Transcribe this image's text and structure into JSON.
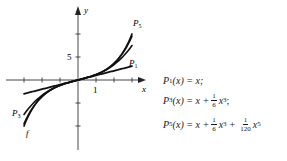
{
  "chart_data": {
    "type": "line",
    "title": "",
    "xlabel": "x",
    "ylabel": "y",
    "x_tick_label": "1",
    "y_tick_label": "5",
    "xlim": [
      -3.2,
      3.4
    ],
    "ylim": [
      -12,
      11
    ],
    "grid": false,
    "series": [
      {
        "name": "f",
        "label": "f",
        "function": "sinh(x)",
        "domain": [
          -3,
          3
        ]
      },
      {
        "name": "P1",
        "label": "P1",
        "function": "x",
        "domain": [
          -3,
          3
        ]
      },
      {
        "name": "P3",
        "label": "P3",
        "function": "x + x^3/6",
        "domain": [
          -3,
          3
        ]
      },
      {
        "name": "P5",
        "label": "P5",
        "function": "x + x^3/6 + x^5/120",
        "domain": [
          -3,
          3
        ]
      }
    ]
  },
  "axes": {
    "x_label": "x",
    "y_label": "y",
    "x_tick": "1",
    "y_tick": "5"
  },
  "labels": {
    "p5": "P",
    "p5_sub": "5",
    "p1": "P",
    "p1_sub": "1",
    "p3": "P",
    "p3_sub": "3",
    "f": "f"
  },
  "formulas": [
    {
      "lhs": "P",
      "sub": "1",
      "arg": "(x) = x;"
    },
    {
      "lhs": "P",
      "sub": "3",
      "arg": "(x) = x +",
      "frac_num": "1",
      "frac_den": "6",
      "tail": "x",
      "tail_sup": "3",
      "end": ";"
    },
    {
      "lhs": "P",
      "sub": "5",
      "arg": "(x) = x +",
      "frac_num": "1",
      "frac_den": "6",
      "tail": "x",
      "tail_sup": "3",
      "plus": "+",
      "frac2_num": "1",
      "frac2_den": "120",
      "tail2": "x",
      "tail2_sup": "5"
    }
  ]
}
